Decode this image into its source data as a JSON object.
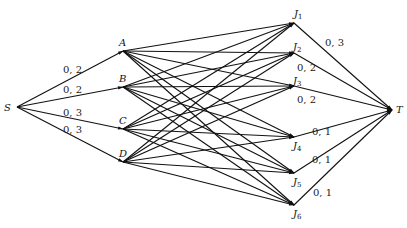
{
  "diagram": {
    "type": "network-flow",
    "nodes": [
      {
        "id": "S",
        "label": "S",
        "x": 17,
        "y": 107,
        "lx": 4,
        "ly": 111
      },
      {
        "id": "A",
        "label": "A",
        "x": 123,
        "y": 51,
        "lx": 119,
        "ly": 46
      },
      {
        "id": "B",
        "label": "B",
        "x": 123,
        "y": 87,
        "lx": 119,
        "ly": 82
      },
      {
        "id": "C",
        "label": "C",
        "x": 123,
        "y": 129,
        "lx": 119,
        "ly": 124
      },
      {
        "id": "D",
        "label": "D",
        "x": 123,
        "y": 162,
        "lx": 119,
        "ly": 157
      },
      {
        "id": "J1",
        "label": "J",
        "sub": "1",
        "x": 294,
        "y": 23,
        "lx": 294,
        "ly": 17
      },
      {
        "id": "J2",
        "label": "J",
        "sub": "2",
        "x": 294,
        "y": 53,
        "lx": 293,
        "ly": 50
      },
      {
        "id": "J3",
        "label": "J",
        "sub": "3",
        "x": 294,
        "y": 86,
        "lx": 293,
        "ly": 84
      },
      {
        "id": "J4",
        "label": "J",
        "sub": "4",
        "x": 294,
        "y": 137,
        "lx": 293,
        "ly": 149
      },
      {
        "id": "J5",
        "label": "J",
        "sub": "5",
        "x": 294,
        "y": 173,
        "lx": 293,
        "ly": 185
      },
      {
        "id": "J6",
        "label": "J",
        "sub": "6",
        "x": 294,
        "y": 205,
        "lx": 293,
        "ly": 217
      },
      {
        "id": "T",
        "label": "T",
        "x": 392,
        "y": 110,
        "lx": 396,
        "ly": 113
      }
    ],
    "source_edges": [
      {
        "from": "S",
        "to": "A",
        "label": "0, 2",
        "lx": 63,
        "ly": 73
      },
      {
        "from": "S",
        "to": "B",
        "label": "0, 2",
        "lx": 63,
        "ly": 93
      },
      {
        "from": "S",
        "to": "C",
        "label": "0, 3",
        "lx": 63,
        "ly": 116
      },
      {
        "from": "S",
        "to": "D",
        "label": "0, 3",
        "lx": 63,
        "ly": 133
      }
    ],
    "sink_edges": [
      {
        "from": "J1",
        "to": "T",
        "label": "0, 3",
        "lx": 325,
        "ly": 46
      },
      {
        "from": "J2",
        "to": "T",
        "label": "0, 2",
        "lx": 297,
        "ly": 71
      },
      {
        "from": "J3",
        "to": "T",
        "label": "0, 2",
        "lx": 297,
        "ly": 103
      },
      {
        "from": "J4",
        "to": "T",
        "label": "0, 1",
        "lx": 312,
        "ly": 135
      },
      {
        "from": "J5",
        "to": "T",
        "label": "0, 1",
        "lx": 312,
        "ly": 163
      },
      {
        "from": "J6",
        "to": "T",
        "label": "0, 1",
        "lx": 313,
        "ly": 196
      }
    ],
    "middle_from": [
      "A",
      "B",
      "C",
      "D"
    ],
    "middle_to": [
      "J1",
      "J2",
      "J3",
      "J4",
      "J5",
      "J6"
    ]
  }
}
